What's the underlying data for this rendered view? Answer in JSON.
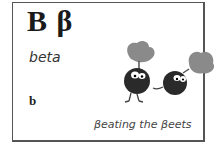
{
  "card": {
    "uppercase": "B",
    "lowercase_greek": "β",
    "letter_pair": "B β",
    "name": "beta",
    "latin_equivalent": "b",
    "caption": "βeating the βeets"
  },
  "illustration": {
    "subject": "two cartoon beets running",
    "colors": {
      "beet_body": "#2a2a2a",
      "leaves": "#8a8a8a"
    }
  }
}
